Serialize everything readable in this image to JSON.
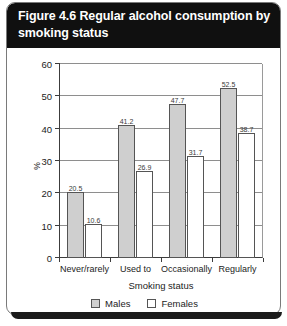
{
  "card": {
    "title": "Figure 4.6 Regular alcohol consumption by smoking status"
  },
  "legend": {
    "items": [
      {
        "label": "Males",
        "swatch": "gray-swatch-icon",
        "color": "#cfcfcf"
      },
      {
        "label": "Females",
        "swatch": "white-swatch-icon",
        "color": "#ffffff"
      }
    ]
  },
  "chart_data": {
    "type": "bar",
    "title": "Figure 4.6 Regular alcohol consumption by smoking status",
    "xlabel": "Smoking status",
    "ylabel": "%",
    "categories": [
      "Never/rarely",
      "Used to",
      "Occasionally",
      "Regularly"
    ],
    "series": [
      {
        "name": "Males",
        "color": "#cfcfcf",
        "values": [
          20.5,
          41.2,
          47.7,
          52.5
        ]
      },
      {
        "name": "Females",
        "color": "#ffffff",
        "values": [
          10.6,
          26.9,
          31.7,
          38.7
        ]
      }
    ],
    "ylim": [
      0,
      60
    ],
    "ytick_step": 10,
    "yticks": [
      0,
      10,
      20,
      30,
      40,
      50,
      60
    ],
    "ytick_labels": [
      "0",
      "10",
      "20",
      "30",
      "40",
      "50",
      "60"
    ],
    "grid": true,
    "legend_position": "bottom-center"
  }
}
